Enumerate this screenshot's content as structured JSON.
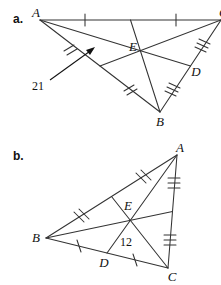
{
  "page": {
    "background_color": "#ffffff",
    "line_color": "#333333",
    "text_color": "#111111"
  },
  "parts": [
    {
      "key": "a",
      "part_label": "a.",
      "figure_type": "triangle-with-medians",
      "description": "Triangle A B C with medians meeting at centroid E; D is midpoint of side BC",
      "vertices": [
        {
          "name": "A",
          "label": "A",
          "x": 40,
          "y": 20
        },
        {
          "name": "B",
          "label": "B",
          "x": 160,
          "y": 112
        },
        {
          "name": "C",
          "label": "C",
          "x": 219,
          "y": 20
        }
      ],
      "points": [
        {
          "name": "E",
          "label": "E",
          "x": 139,
          "y": 55
        },
        {
          "name": "D",
          "label": "D",
          "x": 189,
          "y": 71
        }
      ],
      "measures": [
        {
          "name": "21",
          "label": "21",
          "x": 36,
          "y": 86,
          "segment": "A-to-midpoint-of-BC-side"
        }
      ],
      "tick_groups": [
        {
          "segment": "A-M1",
          "count": 1
        },
        {
          "segment": "M1-C",
          "count": 1
        },
        {
          "segment": "A-M2",
          "count": 2
        },
        {
          "segment": "M2-B",
          "count": 2
        },
        {
          "segment": "C-D",
          "count": 3
        },
        {
          "segment": "D-B",
          "count": 3
        }
      ]
    },
    {
      "key": "b",
      "part_label": "b.",
      "figure_type": "triangle-with-medians",
      "description": "Triangle A B C with medians meeting at centroid E; D is midpoint of side BC",
      "vertices": [
        {
          "name": "A",
          "label": "A",
          "x": 177,
          "y": 155
        },
        {
          "name": "B",
          "label": "B",
          "x": 46,
          "y": 238
        },
        {
          "name": "C",
          "label": "C",
          "x": 168,
          "y": 268
        }
      ],
      "points": [
        {
          "name": "E",
          "label": "E",
          "x": 127,
          "y": 212
        },
        {
          "name": "D",
          "label": "D",
          "x": 104,
          "y": 255
        }
      ],
      "measures": [
        {
          "name": "12",
          "label": "12",
          "x": 122,
          "y": 243,
          "segment": "E-to-D"
        }
      ],
      "tick_groups": [
        {
          "segment": "B-M1",
          "count": 2
        },
        {
          "segment": "M1-A",
          "count": 2
        },
        {
          "segment": "A-M2",
          "count": 3
        },
        {
          "segment": "M2-C",
          "count": 3
        },
        {
          "segment": "B-D",
          "count": 1
        },
        {
          "segment": "D-C",
          "count": 1
        }
      ]
    }
  ]
}
